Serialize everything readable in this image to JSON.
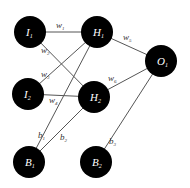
{
  "diagram": {
    "type": "neural-network",
    "colors": {
      "node_fill": "#000000",
      "node_text": "#ffffff",
      "edge": "#555555",
      "label": "#333333",
      "background": "#ffffff"
    },
    "nodes": [
      {
        "id": "I1",
        "main": "I",
        "sub": "1",
        "x": 30,
        "y": 32
      },
      {
        "id": "I2",
        "main": "I",
        "sub": "2",
        "x": 28,
        "y": 94
      },
      {
        "id": "B1",
        "main": "B",
        "sub": "1",
        "x": 29,
        "y": 162
      },
      {
        "id": "H1",
        "main": "H",
        "sub": "1",
        "x": 97,
        "y": 32
      },
      {
        "id": "H2",
        "main": "H",
        "sub": "2",
        "x": 94,
        "y": 97
      },
      {
        "id": "B2",
        "main": "B",
        "sub": "2",
        "x": 96,
        "y": 162
      },
      {
        "id": "O1",
        "main": "O",
        "sub": "1",
        "x": 161,
        "y": 61
      }
    ],
    "edges": [
      {
        "from": "I1",
        "to": "H1"
      },
      {
        "from": "I1",
        "to": "H2"
      },
      {
        "from": "I2",
        "to": "H1"
      },
      {
        "from": "I2",
        "to": "H2"
      },
      {
        "from": "B1",
        "to": "H1"
      },
      {
        "from": "B1",
        "to": "H2"
      },
      {
        "from": "H1",
        "to": "O1"
      },
      {
        "from": "H2",
        "to": "O1"
      },
      {
        "from": "B2",
        "to": "O1"
      }
    ],
    "edge_labels": [
      {
        "main": "w",
        "sub": "1",
        "x": 56,
        "y": 28
      },
      {
        "main": "w",
        "sub": "2",
        "x": 41,
        "y": 53
      },
      {
        "main": "w",
        "sub": "3",
        "x": 41,
        "y": 77
      },
      {
        "main": "w",
        "sub": "4",
        "x": 49,
        "y": 103
      },
      {
        "main": "w",
        "sub": "5",
        "x": 123,
        "y": 40
      },
      {
        "main": "w",
        "sub": "6",
        "x": 108,
        "y": 81
      },
      {
        "main": "b",
        "sub": "1",
        "x": 38,
        "y": 138
      },
      {
        "main": "b",
        "sub": "2",
        "x": 60,
        "y": 140
      },
      {
        "main": "b",
        "sub": "3",
        "x": 109,
        "y": 144
      }
    ]
  }
}
